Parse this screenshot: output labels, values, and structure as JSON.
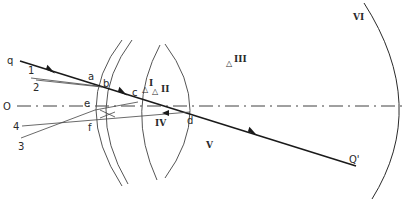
{
  "figure": {
    "colors": {
      "line": "#2a2a2a",
      "thin": "#555555",
      "background": "#ffffff"
    }
  },
  "axis": {
    "label": "O",
    "x": 9,
    "y": 106
  },
  "main_ray": {
    "start_label": "q",
    "end_label": "Q'"
  },
  "points": {
    "a": "a",
    "b": "b",
    "c": "c",
    "d": "d",
    "e": "e",
    "f": "f"
  },
  "reflections": {
    "r1": "1",
    "r2": "2",
    "r3": "3",
    "r4": "4"
  },
  "regions": {
    "I": "I",
    "II": "II",
    "III": "III",
    "IV": "IV",
    "V": "V",
    "VI": "VI"
  }
}
